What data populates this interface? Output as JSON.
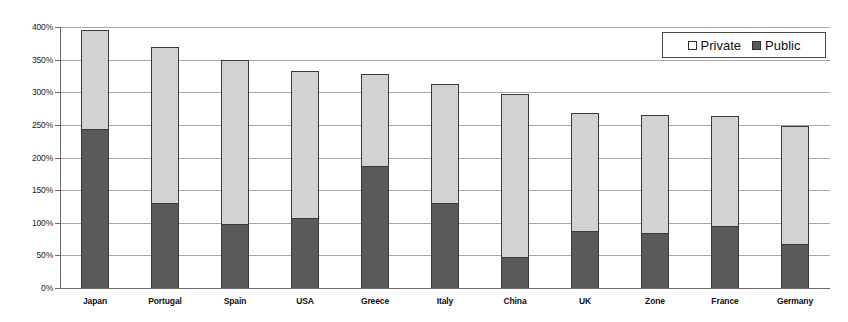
{
  "chart_data": {
    "type": "bar",
    "subtype": "stacked-bar",
    "title": "",
    "xlabel": "",
    "ylabel": "",
    "ylim": [
      0,
      400
    ],
    "y_tick_step": 50,
    "y_tick_labels": [
      "400%",
      "350%",
      "300%",
      "250%",
      "200%",
      "150%",
      "100%",
      "50%",
      "0%"
    ],
    "y_tick_values": [
      400,
      350,
      300,
      250,
      200,
      150,
      100,
      50,
      0
    ],
    "grid": true,
    "legend_position": "top-right",
    "categories": [
      "Japan",
      "Portugal",
      "Spain",
      "USA",
      "Greece",
      "Italy",
      "China",
      "UK",
      "Zone",
      "France",
      "Germany"
    ],
    "series": [
      {
        "name": "Public",
        "color": "#5a5a5a",
        "values": [
          243,
          130,
          98,
          108,
          187,
          130,
          47,
          87,
          85,
          95,
          67
        ]
      },
      {
        "name": "Private",
        "color": "#d2d2d2",
        "values": [
          152,
          240,
          251,
          224,
          141,
          183,
          251,
          181,
          180,
          169,
          182
        ]
      }
    ],
    "totals": [
      395,
      370,
      349,
      332,
      328,
      313,
      298,
      268,
      265,
      264,
      249
    ]
  },
  "legend": {
    "items": [
      {
        "label": "Private",
        "swatch": "private"
      },
      {
        "label": "Public",
        "swatch": "public"
      }
    ]
  },
  "colors": {
    "private": "#d2d2d2",
    "public": "#5a5a5a",
    "gridline": "#a8a8a8",
    "axis": "#6a6a6a",
    "background": "#ffffff"
  }
}
